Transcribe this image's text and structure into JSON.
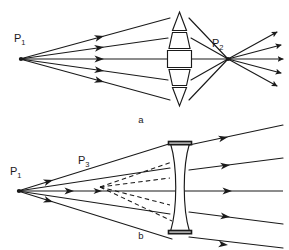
{
  "figure": {
    "background_color": "#ffffff",
    "line_color": "#1a1a1a",
    "width": 289,
    "height": 250
  },
  "panels": [
    {
      "id": "panel-a",
      "caption": "a",
      "description": "Converging (segmented convex) lens focusing rays from P1 to a real image point P2",
      "lens_type": "converging-segmented-convex",
      "lens_segments": 5,
      "labels": [
        {
          "name": "point-p1",
          "base": "P",
          "sub": "1",
          "x": 14,
          "y": 42
        },
        {
          "name": "point-p2",
          "base": "P",
          "sub": "2",
          "x": 212,
          "y": 47
        }
      ],
      "source_point": {
        "label": "P1",
        "x": 20,
        "y": 59
      },
      "focus_point": {
        "label": "P2",
        "x": 228,
        "y": 59
      },
      "incident_ray_count": 5,
      "emergent_ray_count": 5
    },
    {
      "id": "panel-b",
      "caption": "b",
      "description": "Diverging (biconcave) lens spreading rays from P1; emergent rays appear to come from virtual image point P3",
      "lens_type": "diverging-biconcave",
      "lens_segments": 1,
      "labels": [
        {
          "name": "point-p1",
          "base": "P",
          "sub": "1",
          "x": 10,
          "y": 175
        },
        {
          "name": "point-p3",
          "base": "P",
          "sub": "3",
          "x": 78,
          "y": 164
        }
      ],
      "source_point": {
        "label": "P1",
        "x": 18,
        "y": 191
      },
      "virtual_point": {
        "label": "P3",
        "x": 100,
        "y": 187
      },
      "incident_ray_count": 5,
      "emergent_ray_count": 5,
      "virtual_ray_count": 4,
      "virtual_ray_style": "dashed"
    }
  ],
  "captions": {
    "panel_a": "a",
    "panel_b": "b"
  }
}
